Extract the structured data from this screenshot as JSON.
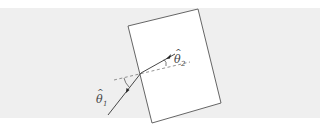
{
  "figure": {
    "type": "refraction-diagram",
    "labels": {
      "theta1": {
        "symbol": "θ",
        "hat": "^",
        "subscript": "1"
      },
      "theta2": {
        "symbol": "θ",
        "hat": "^",
        "subscript": "2"
      }
    },
    "colors": {
      "background_band": "#efefef",
      "slab_fill": "#ffffff",
      "slab_stroke": "#555555",
      "ray": "#333333",
      "normal_dashed": "#666666",
      "label": "#444444"
    }
  }
}
